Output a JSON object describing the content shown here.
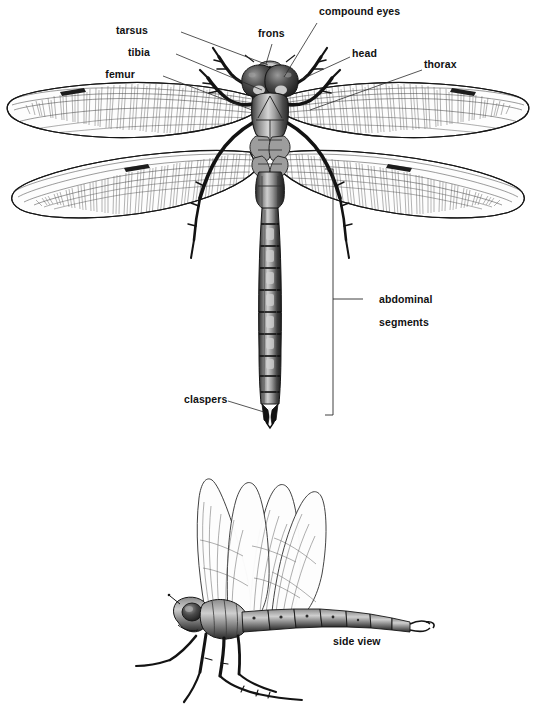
{
  "figure": {
    "background_color": "#ffffff",
    "ink_color": "#111111",
    "views": [
      {
        "name": "dorsal-view",
        "description": "dorsal (top) view of dragonfly with labelled anatomy"
      },
      {
        "name": "side-view",
        "description": "lateral view of dragonfly with wings raised"
      }
    ]
  },
  "labels": {
    "tarsus": "tarsus",
    "tibia": "tibia",
    "femur": "femur",
    "frons": "frons",
    "compound_eyes": "compound eyes",
    "head": "head",
    "thorax": "thorax",
    "abdominal_segments_line1": "abdominal",
    "abdominal_segments_line2": "segments",
    "claspers": "claspers",
    "side_view": "side view"
  },
  "label_positions": {
    "tarsus": {
      "x": 148,
      "y": 30,
      "anchor": "right"
    },
    "tibia": {
      "x": 150,
      "y": 52,
      "anchor": "right"
    },
    "femur": {
      "x": 135,
      "y": 74,
      "anchor": "right"
    },
    "frons": {
      "x": 258,
      "y": 33,
      "anchor": "left"
    },
    "compound_eyes": {
      "x": 319,
      "y": 10,
      "anchor": "left"
    },
    "head": {
      "x": 352,
      "y": 52,
      "anchor": "left"
    },
    "thorax": {
      "x": 424,
      "y": 63,
      "anchor": "left"
    },
    "abdominal": {
      "x": 367,
      "y": 284,
      "anchor": "left"
    },
    "claspers": {
      "x": 184,
      "y": 398,
      "anchor": "left"
    },
    "side_view": {
      "x": 333,
      "y": 641,
      "anchor": "left"
    }
  },
  "leader_lines": [
    {
      "name": "tarsus-leader",
      "from": [
        181,
        32
      ],
      "to": [
        268,
        65
      ]
    },
    {
      "name": "tibia-leader",
      "from": [
        176,
        54
      ],
      "to": [
        262,
        90
      ]
    },
    {
      "name": "femur-leader",
      "from": [
        163,
        76
      ],
      "to": [
        252,
        110
      ]
    },
    {
      "name": "frons-leader",
      "from": [
        272,
        44
      ],
      "to": [
        265,
        68
      ]
    },
    {
      "name": "compound-eyes-leader",
      "from": [
        317,
        23
      ],
      "to": [
        283,
        78
      ]
    },
    {
      "name": "head-leader",
      "from": [
        350,
        57
      ],
      "to": [
        307,
        79
      ]
    },
    {
      "name": "thorax-leader",
      "from": [
        422,
        70
      ],
      "to": [
        318,
        108
      ]
    },
    {
      "name": "abdominal-leader",
      "from": [
        363,
        299
      ],
      "to": [
        333,
        299
      ]
    },
    {
      "name": "claspers-leader",
      "from": [
        228,
        401
      ],
      "to": [
        266,
        411
      ]
    }
  ],
  "bracket": {
    "name": "abdominal-segments-bracket",
    "x": 333,
    "y_top": 169,
    "y_bottom": 415,
    "tick": 8
  },
  "anatomy_parts": [
    "compound eyes",
    "frons",
    "head",
    "thorax",
    "femur",
    "tibia",
    "tarsus",
    "abdominal segments",
    "claspers",
    "forewing",
    "hindwing",
    "pterostigma"
  ],
  "colors": {
    "line": "#1a1a1a",
    "wing_vein": "#2b2b2b",
    "body_dark": "#2e2e2e",
    "body_mid": "#6d6d6d",
    "body_light": "#b8b8b8",
    "highlight": "#e6e6e6",
    "leader": "#2a2a2a",
    "background": "#ffffff"
  }
}
